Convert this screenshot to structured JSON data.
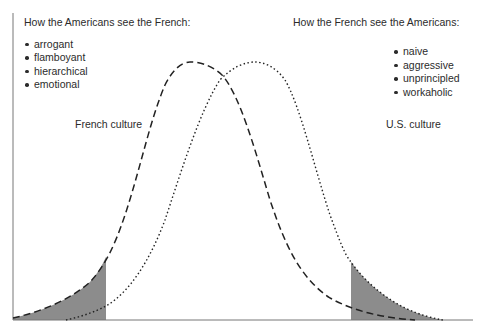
{
  "diagram": {
    "left_panel": {
      "heading": "How the Americans see the French:",
      "traits": [
        "arrogant",
        "flamboyant",
        "hierarchical",
        "emotional"
      ]
    },
    "right_panel": {
      "heading": "How the French see the Americans:",
      "traits": [
        "naive",
        "aggressive",
        "unprincipled",
        "workaholic"
      ]
    },
    "curves": [
      {
        "name": "French culture",
        "label": "French culture",
        "style": "dashed",
        "color": "#222222"
      },
      {
        "name": "U.S. culture",
        "label": "U.S. culture",
        "style": "dotted",
        "color": "#222222"
      }
    ],
    "shading": {
      "color": "#8c8c8c",
      "regions": [
        "left tail of French culture",
        "right tail of U.S. culture"
      ]
    },
    "axis_color": "#777777"
  }
}
